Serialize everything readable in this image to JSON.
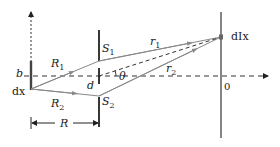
{
  "diagram": {
    "title": "",
    "labels": {
      "b": "b",
      "dx": "dx",
      "R1": "R",
      "R1_sub": "1",
      "R2": "R",
      "R2_sub": "2",
      "d": "d",
      "S1": "S",
      "S1_sub": "1",
      "S2": "S",
      "S2_sub": "2",
      "r1": "r",
      "r1_sub": "1",
      "r2": "r",
      "r2_sub": "2",
      "theta": "θ",
      "dIx": "dIx",
      "origin": "0",
      "R": "R"
    },
    "colors": {
      "ray": "#888888",
      "line": "#222222",
      "dashed": "#333333"
    }
  }
}
